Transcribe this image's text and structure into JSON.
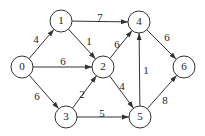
{
  "graph": {
    "type": "directed-weighted",
    "nodes": [
      {
        "id": "0",
        "label": "0",
        "x": 22,
        "y": 67
      },
      {
        "id": "1",
        "label": "1",
        "x": 61,
        "y": 21
      },
      {
        "id": "2",
        "label": "2",
        "x": 103,
        "y": 67
      },
      {
        "id": "3",
        "label": "3",
        "x": 66,
        "y": 117
      },
      {
        "id": "4",
        "label": "4",
        "x": 139,
        "y": 22
      },
      {
        "id": "5",
        "label": "5",
        "x": 140,
        "y": 117
      },
      {
        "id": "6",
        "label": "6",
        "x": 184,
        "y": 67
      }
    ],
    "edges": [
      {
        "from": "0",
        "to": "1",
        "weight": "4",
        "lx": 36,
        "ly": 40
      },
      {
        "from": "0",
        "to": "2",
        "weight": "6",
        "lx": 63,
        "ly": 62
      },
      {
        "from": "0",
        "to": "3",
        "weight": "6",
        "lx": 37,
        "ly": 97
      },
      {
        "from": "1",
        "to": "2",
        "weight": "1",
        "lx": 89,
        "ly": 42
      },
      {
        "from": "1",
        "to": "4",
        "weight": "7",
        "lx": 100,
        "ly": 18
      },
      {
        "from": "2",
        "to": "4",
        "weight": "6",
        "lx": 117,
        "ly": 45
      },
      {
        "from": "2",
        "to": "5",
        "weight": "4",
        "lx": 122,
        "ly": 87
      },
      {
        "from": "3",
        "to": "2",
        "weight": "2",
        "lx": 82,
        "ly": 95
      },
      {
        "from": "3",
        "to": "5",
        "weight": "5",
        "lx": 102,
        "ly": 114
      },
      {
        "from": "5",
        "to": "4",
        "weight": "1",
        "lx": 146,
        "ly": 71
      },
      {
        "from": "4",
        "to": "6",
        "weight": "6",
        "lx": 167,
        "ly": 38
      },
      {
        "from": "5",
        "to": "6",
        "weight": "8",
        "lx": 165,
        "ly": 101
      }
    ],
    "node_radius": 11,
    "colors": {
      "stroke": "#333333",
      "text": "#222222",
      "background": "#ffffff"
    }
  }
}
